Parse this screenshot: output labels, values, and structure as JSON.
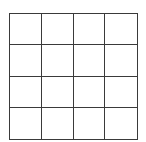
{
  "grid": {
    "rows": 4,
    "columns": 4,
    "line_color": "#3a3a3a",
    "background": "#ffffff",
    "cells": [
      [
        "",
        "",
        "",
        ""
      ],
      [
        "",
        "",
        "",
        ""
      ],
      [
        "",
        "",
        "",
        ""
      ],
      [
        "",
        "",
        "",
        ""
      ]
    ]
  }
}
